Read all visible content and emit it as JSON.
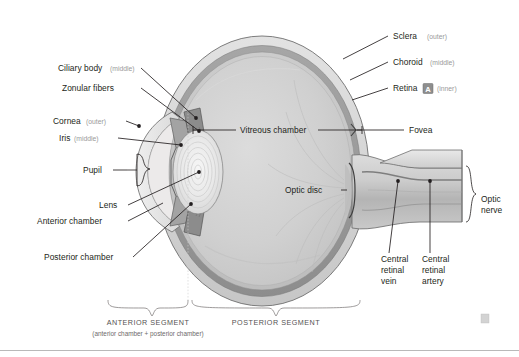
{
  "figure": {
    "background_color": "#ffffff",
    "width": 519,
    "height": 357
  },
  "labels": {
    "sclera": {
      "name": "Sclera",
      "qualifier": "(outer)"
    },
    "choroid": {
      "name": "Choroid",
      "qualifier": "(middle)"
    },
    "retina": {
      "name": "Retina",
      "qualifier": "(inner)",
      "marker": "A"
    },
    "fovea": {
      "name": "Fovea",
      "qualifier": ""
    },
    "optic_disc": {
      "name": "Optic disc",
      "qualifier": ""
    },
    "optic_nerve_line1": "Optic",
    "optic_nerve_line2": "nerve",
    "central_retinal_vein_line1": "Central",
    "central_retinal_vein_line2": "retinal",
    "central_retinal_vein_line3": "vein",
    "central_retinal_artery_line1": "Central",
    "central_retinal_artery_line2": "retinal",
    "central_retinal_artery_line3": "artery",
    "ciliary_body": {
      "name": "Ciliary body",
      "qualifier": "(middle)"
    },
    "zonular_fibers": {
      "name": "Zonular fibers",
      "qualifier": ""
    },
    "cornea": {
      "name": "Cornea",
      "qualifier": "(outer)"
    },
    "iris": {
      "name": "Iris",
      "qualifier": "(middle)"
    },
    "pupil": {
      "name": "Pupil",
      "qualifier": ""
    },
    "lens": {
      "name": "Lens",
      "qualifier": ""
    },
    "anterior_chamber": {
      "name": "Anterior chamber",
      "qualifier": ""
    },
    "posterior_chamber": {
      "name": "Posterior chamber",
      "qualifier": ""
    },
    "vitreous_chamber": {
      "name": "Vitreous chamber",
      "qualifier": ""
    }
  },
  "segments": {
    "anterior": {
      "title": "ANTERIOR SEGMENT",
      "subtitle": "(anterior chamber + posterior chamber)"
    },
    "posterior": {
      "title": "POSTERIOR SEGMENT",
      "subtitle": ""
    }
  },
  "colors": {
    "sclera": "#d8d8d8",
    "choroid": "#9d9d9d",
    "retina": "#c6c6c6",
    "vitreous": "#cfcfcf",
    "lens": "#efefef",
    "cornea": "#e6e6e6",
    "line": "#231f20",
    "text": "#231f20",
    "qualifier_text": "#9a9a9a",
    "segment_text": "#555252"
  }
}
